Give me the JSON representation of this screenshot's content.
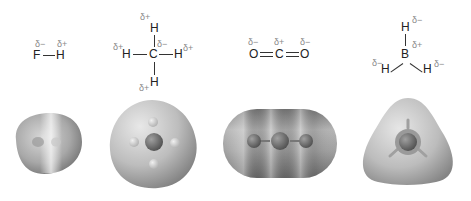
{
  "molecules": [
    {
      "name": "HF",
      "atoms": {
        "a1": "F",
        "a2": "H"
      },
      "charges": {
        "a1": "δ−",
        "a2": "δ+"
      }
    },
    {
      "name": "CH4",
      "atoms": {
        "center": "C",
        "top": "H",
        "left": "H",
        "right": "H",
        "bottom": "H"
      },
      "charges": {
        "center": "δ−",
        "top": "δ+",
        "left": "δ+",
        "right": "δ+",
        "bottom": "δ+"
      }
    },
    {
      "name": "CO2",
      "atoms": {
        "left": "O",
        "center": "C",
        "right": "O"
      },
      "charges": {
        "left": "δ−",
        "center": "δ+",
        "right": "δ−"
      }
    },
    {
      "name": "BH3",
      "atoms": {
        "center": "B",
        "top": "H",
        "left": "H",
        "right": "H"
      },
      "charges": {
        "center": "δ+",
        "top": "δ−",
        "left": "δ−",
        "right": "δ−"
      }
    }
  ],
  "colors": {
    "background": "#ffffff",
    "structure_text": "#222222",
    "charge_text": "#8a8a8a",
    "surface_light": "#dcdcdc",
    "surface_dark": "#8c8c8c"
  }
}
